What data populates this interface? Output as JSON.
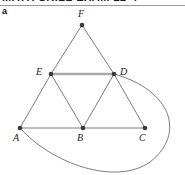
{
  "header": {
    "clipped_text": "MATH SKILL EXAM 22-4"
  },
  "figure": {
    "part_label": "a",
    "colors": {
      "edge": "#6d6d6d",
      "edge_highlight": "#a8a8a8",
      "vertex": "#3a3a3a",
      "label": "#1a1a1a",
      "rule": "#9a9a9a",
      "background": "#ffffff"
    }
  },
  "graph": {
    "type": "undirected-graph",
    "vertices": [
      {
        "id": "F",
        "label": "F",
        "x": 82,
        "y": 19,
        "label_x": 78,
        "label_y": 3
      },
      {
        "id": "E",
        "label": "E",
        "x": 51,
        "y": 68,
        "label_x": 36,
        "label_y": 61
      },
      {
        "id": "D",
        "label": "D",
        "x": 114,
        "y": 68,
        "label_x": 120,
        "label_y": 61
      },
      {
        "id": "A",
        "label": "A",
        "x": 20,
        "y": 122,
        "label_x": 13,
        "label_y": 127
      },
      {
        "id": "B",
        "label": "B",
        "x": 83,
        "y": 122,
        "label_x": 77,
        "label_y": 127
      },
      {
        "id": "C",
        "label": "C",
        "x": 145,
        "y": 122,
        "label_x": 139,
        "label_y": 127
      }
    ],
    "edges": [
      {
        "from": "F",
        "to": "E",
        "style": "straight",
        "highlight": false
      },
      {
        "from": "F",
        "to": "D",
        "style": "straight",
        "highlight": false
      },
      {
        "from": "E",
        "to": "D",
        "style": "straight",
        "highlight": true
      },
      {
        "from": "E",
        "to": "A",
        "style": "straight",
        "highlight": false
      },
      {
        "from": "E",
        "to": "B",
        "style": "straight",
        "highlight": false
      },
      {
        "from": "D",
        "to": "B",
        "style": "straight",
        "highlight": false
      },
      {
        "from": "D",
        "to": "C",
        "style": "straight",
        "highlight": false
      },
      {
        "from": "A",
        "to": "B",
        "style": "straight",
        "highlight": false
      },
      {
        "from": "B",
        "to": "C",
        "style": "straight",
        "highlight": false
      },
      {
        "from": "D",
        "to": "A",
        "style": "curved",
        "highlight": false,
        "path": "M 114 68 C 172 84 186 128 150 156 C 116 180 52 158 20 122"
      }
    ]
  }
}
